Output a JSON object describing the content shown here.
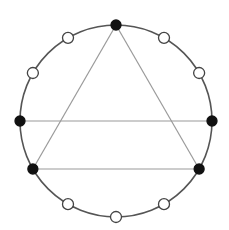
{
  "diagram": {
    "type": "clock-diagram",
    "circle": {
      "cx": 116,
      "cy": 121,
      "r": 96,
      "stroke": "#555555"
    },
    "point_count": 12,
    "points": [
      {
        "index": 0,
        "filled": true
      },
      {
        "index": 1,
        "filled": false
      },
      {
        "index": 2,
        "filled": false
      },
      {
        "index": 3,
        "filled": true
      },
      {
        "index": 4,
        "filled": true
      },
      {
        "index": 5,
        "filled": false
      },
      {
        "index": 6,
        "filled": false
      },
      {
        "index": 7,
        "filled": false
      },
      {
        "index": 8,
        "filled": true
      },
      {
        "index": 9,
        "filled": true
      },
      {
        "index": 10,
        "filled": false
      },
      {
        "index": 11,
        "filled": false
      }
    ],
    "edges": [
      [
        0,
        4
      ],
      [
        4,
        8
      ],
      [
        8,
        0
      ],
      [
        9,
        3
      ]
    ],
    "colors": {
      "filled": "#111111",
      "open_fill": "#ffffff",
      "point_stroke": "#444444",
      "edge": "#9a9a9a"
    }
  }
}
